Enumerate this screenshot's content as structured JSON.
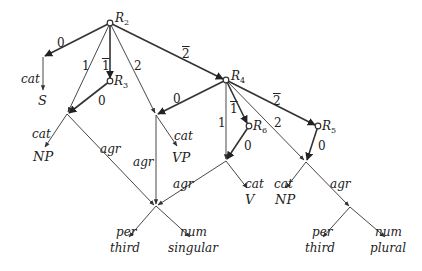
{
  "diagram": {
    "type": "feature-structure-graph",
    "named_nodes": [
      {
        "id": "R2",
        "label": "R",
        "sub": "2",
        "x": 110,
        "y": 23
      },
      {
        "id": "R3",
        "label": "R",
        "sub": "3",
        "x": 110,
        "y": 81
      },
      {
        "id": "R4",
        "label": "R",
        "sub": "4",
        "x": 226,
        "y": 80
      },
      {
        "id": "R6",
        "label": "R",
        "sub": "6",
        "x": 249,
        "y": 126
      },
      {
        "id": "R5",
        "label": "R",
        "sub": "5",
        "x": 318,
        "y": 126
      }
    ],
    "edge_labels": {
      "r2_0": "0",
      "r2_1": "1",
      "r2_1bar": "1",
      "r2_2": "2",
      "r2_2bar": "2",
      "r3_0": "0",
      "r4_0": "0",
      "r4_1": "1",
      "r4_1bar": "1",
      "r4_2": "2",
      "r4_2bar": "2",
      "r6_0": "0",
      "r5_0": "0",
      "cat_s": "cat",
      "cat_np_left": "cat",
      "agr_left": "agr",
      "agr_mid": "agr",
      "cat_vp": "cat",
      "agr_v": "agr",
      "cat_v": "cat",
      "cat_np_right": "cat",
      "agr_right": "agr",
      "per_left": "per",
      "num_left": "num",
      "per_right": "per",
      "num_right": "num"
    },
    "leaf_values": {
      "s": "S",
      "np_left": "NP",
      "vp": "VP",
      "v": "V",
      "np_right": "NP",
      "third_left": "third",
      "singular": "singular",
      "third_right": "third",
      "plural": "plural"
    },
    "colors": {
      "edge": "#333333",
      "text": "#222222",
      "background": "#ffffff"
    }
  }
}
